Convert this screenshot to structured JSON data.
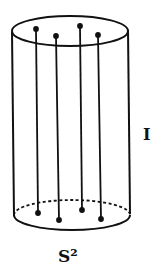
{
  "figure": {
    "labels": {
      "interval": "I",
      "sphere": "S²"
    },
    "colors": {
      "stroke": "#111111",
      "background": "#ffffff"
    },
    "cylinder": {
      "top_ellipse": {
        "cx": 70,
        "cy": 31,
        "rx": 58,
        "ry": 15
      },
      "bottom_ellipse": {
        "cx": 72,
        "cy": 215,
        "rx": 58,
        "ry": 15
      },
      "fibers": [
        {
          "x_top": 36,
          "y_top": 29,
          "x_bottom": 38,
          "y_bottom": 213
        },
        {
          "x_top": 56,
          "y_top": 36,
          "x_bottom": 59,
          "y_bottom": 220
        },
        {
          "x_top": 80,
          "y_top": 26,
          "x_bottom": 82,
          "y_bottom": 210
        },
        {
          "x_top": 98,
          "y_top": 35,
          "x_bottom": 101,
          "y_bottom": 219
        }
      ]
    }
  }
}
